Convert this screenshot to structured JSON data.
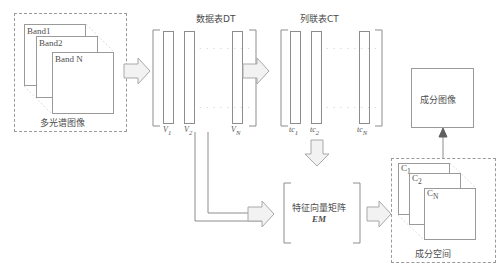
{
  "diagram": {
    "title_dt": "数据表DT",
    "title_ct": "列联表CT",
    "multispectral": {
      "caption": "多光谱图像",
      "bands": [
        "Band1",
        "Band2",
        "Band N"
      ]
    },
    "dt": {
      "labels": [
        "V",
        "V",
        "V"
      ],
      "subscripts": [
        "1",
        "2",
        "N"
      ],
      "dots": "· · · · · · · ·"
    },
    "ct": {
      "labels": [
        "tc",
        "tc",
        "tc"
      ],
      "subscripts": [
        "1",
        "2",
        "N"
      ],
      "dots": "· · · · · · · ·"
    },
    "em": {
      "caption": "特征向量矩阵",
      "symbol": "EM"
    },
    "component_space": {
      "caption": "成分空间",
      "layers": [
        "C",
        "C",
        "C"
      ],
      "subscripts": [
        "1",
        "2",
        "N"
      ]
    },
    "component_image": {
      "caption": "成分图像"
    },
    "colors": {
      "stroke": "#8d8d8d",
      "arrow_fill": "#f2f2f2",
      "arrow_stroke": "#a8a8a8",
      "dash": "#9a9a9a",
      "text": "#4a4a4a"
    }
  }
}
